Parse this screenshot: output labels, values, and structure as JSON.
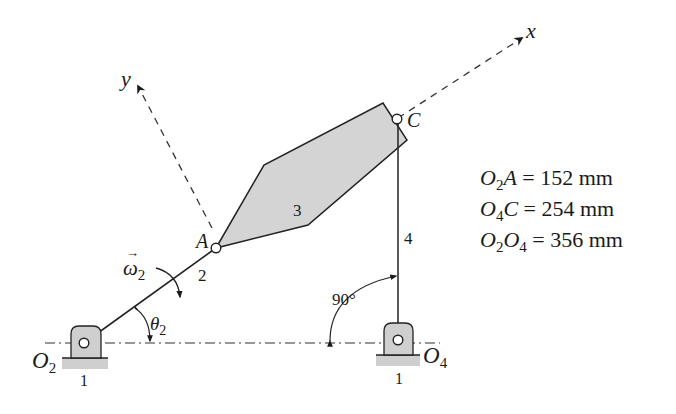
{
  "diagram": {
    "type": "four-bar linkage",
    "axes": {
      "x_label": "x",
      "y_label": "y"
    },
    "links": [
      {
        "id": "1",
        "label": "1",
        "role": "ground"
      },
      {
        "id": "2",
        "label": "2",
        "role": "crank O2A"
      },
      {
        "id": "3",
        "label": "3",
        "role": "coupler"
      },
      {
        "id": "4",
        "label": "4",
        "role": "rocker O4C"
      }
    ],
    "points": {
      "O2": {
        "main": "O",
        "sub": "2"
      },
      "O4": {
        "main": "O",
        "sub": "4"
      },
      "A": "A",
      "C": "C"
    },
    "angular_velocity": {
      "symbol": "ω",
      "sub": "2",
      "vector_arrow": "→"
    },
    "angle_theta": {
      "symbol": "θ",
      "sub": "2"
    },
    "angle_90": "90°",
    "ground_labels": [
      "1",
      "1"
    ]
  },
  "givens": [
    {
      "lhs_a": "O",
      "lhs_a_sub": "2",
      "lhs_b": "A",
      "lhs_b_sub": "",
      "value": "= 152 mm"
    },
    {
      "lhs_a": "O",
      "lhs_a_sub": "4",
      "lhs_b": "C",
      "lhs_b_sub": "",
      "value": "= 254 mm"
    },
    {
      "lhs_a": "O",
      "lhs_a_sub": "2",
      "lhs_b": "O",
      "lhs_b_sub": "4",
      "value": "= 356 mm"
    }
  ]
}
